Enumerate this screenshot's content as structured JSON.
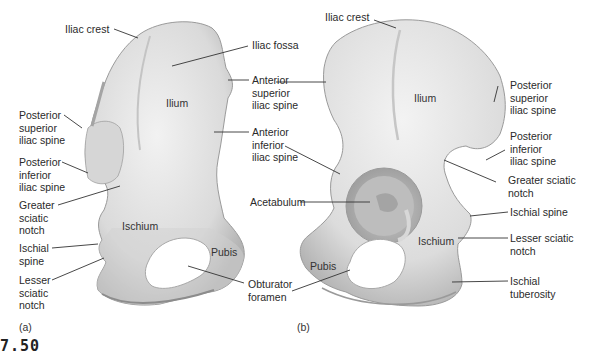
{
  "figure_number": "7.50",
  "panels": [
    {
      "id": "a",
      "label": "(a)",
      "region_labels": [
        "Ilium",
        "Ischium",
        "Pubis"
      ],
      "callouts": [
        {
          "text": "Iliac crest"
        },
        {
          "text": "Iliac fossa"
        },
        {
          "text": "Anterior\nsuperior\niliac spine"
        },
        {
          "text": "Anterior\ninferior\niliac spine"
        },
        {
          "text": "Posterior\nsuperior\niliac spine"
        },
        {
          "text": "Posterior\ninferior\niliac spine"
        },
        {
          "text": "Greater\nsciatic\nnotch"
        },
        {
          "text": "Ischial\nspine"
        },
        {
          "text": "Lesser\nsciatic\nnotch"
        },
        {
          "text": "Obturator\nforamen"
        }
      ]
    },
    {
      "id": "b",
      "label": "(b)",
      "region_labels": [
        "Ilium",
        "Ischium",
        "Pubis"
      ],
      "callouts": [
        {
          "text": "Iliac crest"
        },
        {
          "text": "Acetabulum"
        },
        {
          "text": "Posterior\nsuperior\niliac spine"
        },
        {
          "text": "Posterior\ninferior\niliac spine"
        },
        {
          "text": "Greater sciatic\nnotch"
        },
        {
          "text": "Ischial spine"
        },
        {
          "text": "Lesser sciatic\nnotch"
        },
        {
          "text": "Ischial\ntuberosity"
        }
      ]
    }
  ],
  "colors": {
    "bone_light": "#ececec",
    "bone_mid": "#d2d2d2",
    "bone_dark": "#a8a8a8",
    "leader_line": "#333333",
    "text": "#2a2a2a"
  }
}
